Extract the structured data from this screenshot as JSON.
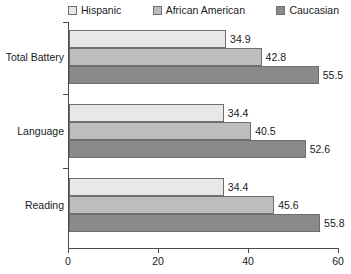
{
  "chart_data": {
    "type": "bar",
    "orientation": "horizontal",
    "title": "",
    "xlabel": "",
    "ylabel": "",
    "categories": [
      "Total Battery",
      "Language",
      "Reading"
    ],
    "series": [
      {
        "name": "Hispanic",
        "color": "#e8e8e8",
        "values": [
          34.9,
          34.4,
          34.4
        ]
      },
      {
        "name": "African American",
        "color": "#bdbdbd",
        "values": [
          42.8,
          40.5,
          45.6
        ]
      },
      {
        "name": "Caucasian",
        "color": "#8a8a8a",
        "values": [
          55.5,
          52.6,
          55.8
        ]
      }
    ],
    "xlim": [
      0,
      60
    ],
    "xticks": [
      0,
      20,
      40,
      60
    ],
    "xtick_labels": [
      "0",
      "20",
      "40",
      "60"
    ],
    "grid": false,
    "legend_position": "top",
    "bar_border_color": "#6e6e6e",
    "axis_color": "#4a4a4a"
  }
}
